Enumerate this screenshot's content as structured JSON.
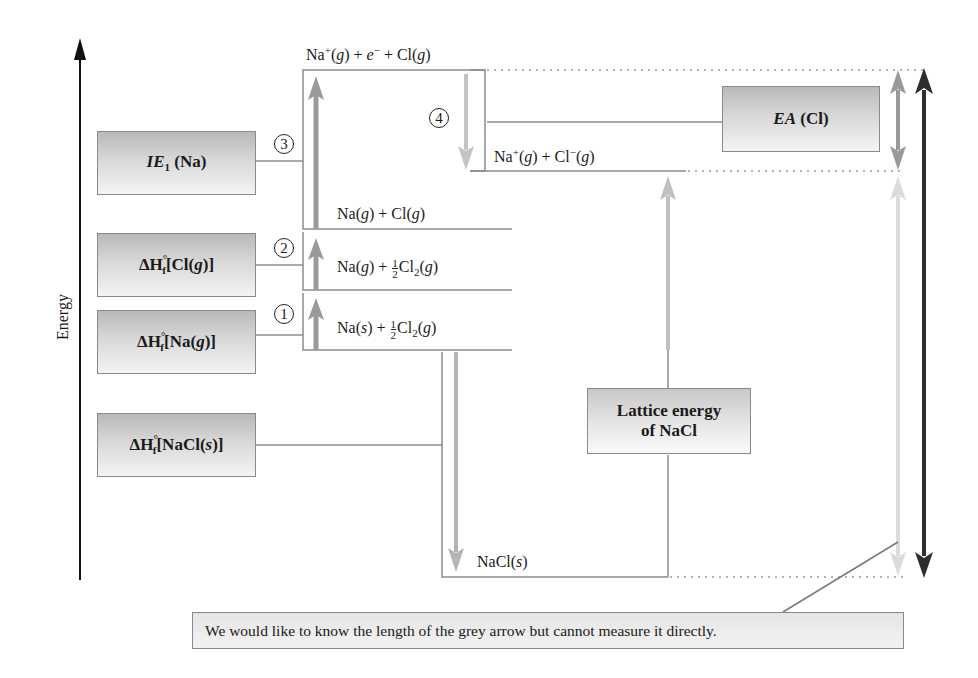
{
  "diagram": {
    "axis": {
      "label": "Energy",
      "direction": "up"
    },
    "energy_levels": [
      {
        "id": "top",
        "text": "Na⁺(g) + e⁻ + Cl(g)"
      },
      {
        "id": "ions",
        "text": "Na⁺(g) + Cl⁻(g)"
      },
      {
        "id": "na_g_cl_g",
        "text": "Na(g) + Cl(g)"
      },
      {
        "id": "na_g_half",
        "text": "Na(g) + ½Cl₂(g)"
      },
      {
        "id": "elements",
        "text": "Na(s) + ½Cl₂(g)"
      },
      {
        "id": "nacl_s",
        "text": "NaCl(s)"
      }
    ],
    "steps": [
      {
        "number": "1",
        "label": "ΔH°f[Na(g)]"
      },
      {
        "number": "2",
        "label": "ΔH°f[Cl(g)]"
      },
      {
        "number": "3",
        "label": "IE1 (Na)"
      },
      {
        "number": "4",
        "label": "EA (Cl)"
      }
    ],
    "boxes": {
      "ie1": {
        "main": "IE",
        "sub": "1",
        "rest": " (Na)"
      },
      "hf_cl": {
        "prefix": "ΔH",
        "sup": "°",
        "sub": "f",
        "rest": "[Cl(",
        "ital": "g",
        "close": ")]"
      },
      "hf_na": {
        "prefix": "ΔH",
        "sup": "°",
        "sub": "f",
        "rest": "[Na(",
        "ital": "g",
        "close": ")]"
      },
      "hf_nacl": {
        "prefix": "ΔH",
        "sup": "°",
        "sub": "f",
        "rest": "[NaCl(",
        "ital": "s",
        "close": ")]"
      },
      "ea": {
        "ital": "EA",
        "rest": " (Cl)"
      },
      "lattice": {
        "line1": "Lattice energy",
        "line2": "of NaCl"
      }
    },
    "level_labels": {
      "top": {
        "a": "Na",
        "a_sup": "+",
        "b": "(",
        "b_i": "g",
        "c": ") + ",
        "d_i": "e",
        "d_sup": "−",
        "e": " + Cl(",
        "e_i": "g",
        "f": ")"
      },
      "ions": {
        "a": "Na",
        "a_sup": "+",
        "b": "(",
        "b_i": "g",
        "c": ") + Cl",
        "c_sup": "−",
        "d": "(",
        "d_i": "g",
        "e": ")"
      },
      "na_g_cl_g": {
        "a": "Na(",
        "a_i": "g",
        "b": ") + Cl(",
        "b_i": "g",
        "c": ")"
      },
      "na_g_half": {
        "a": "Na(",
        "a_i": "g",
        "b": ") + ",
        "num": "1",
        "den": "2",
        "c": "Cl",
        "c_sub": "2",
        "d": "(",
        "d_i": "g",
        "e": ")"
      },
      "elements": {
        "a": "Na(",
        "a_i": "s",
        "b": ") + ",
        "num": "1",
        "den": "2",
        "c": "Cl",
        "c_sub": "2",
        "d": "(",
        "d_i": "g",
        "e": ")"
      },
      "nacl_s": {
        "a": "NaCl(",
        "a_i": "s",
        "b": ")"
      }
    },
    "caption": "We would like to know the length of the grey arrow but cannot measure it directly.",
    "colors": {
      "arrow_medium": "#9a9a9a",
      "arrow_light": "#c8c8c8",
      "arrow_pale": "#dedede",
      "arrow_dark": "#2e2e2e",
      "line": "#8c8c8c",
      "axis": "#111111"
    }
  }
}
